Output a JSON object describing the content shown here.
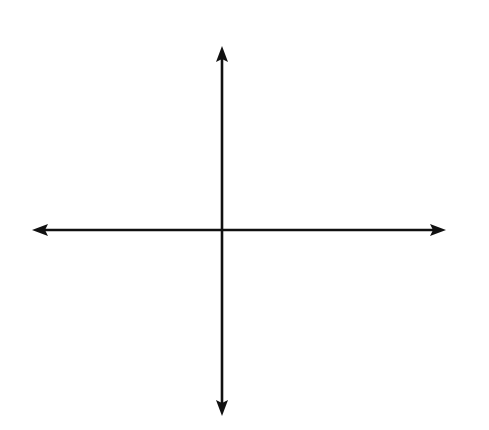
{
  "diagram": {
    "axes": {
      "x_label": "x",
      "y_label": "y",
      "x_ticks": [
        "−4",
        "−3",
        "−2",
        "−1",
        "0",
        "1",
        "2",
        "3",
        "4",
        "5"
      ],
      "y_ticks_pos": [
        "1",
        "2",
        "3",
        "4"
      ],
      "y_ticks_neg": [
        "−1",
        "−2",
        "−3",
        "−4"
      ]
    },
    "quadrants": [
      {
        "name": "I",
        "position": "upper-right"
      },
      {
        "name": "II",
        "position": "upper-left"
      },
      {
        "name": "III",
        "position": "lower-left"
      },
      {
        "name": "IV",
        "position": "lower-right"
      }
    ],
    "grid": {
      "columns": 11,
      "rows": 10,
      "line_color": "#a8a8a8"
    },
    "colors": {
      "axis": "#111111",
      "grid": "#a8a8a8",
      "background": "#ffffff"
    }
  }
}
